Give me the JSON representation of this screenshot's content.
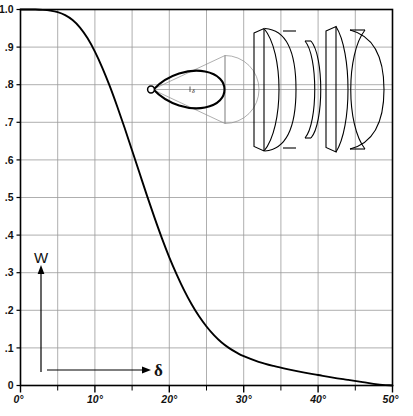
{
  "figure": {
    "title": "",
    "background_color": "#ffffff",
    "frame_color": "#000000",
    "grid_color": "#9a9a9a",
    "curve_color": "#000000"
  },
  "axes": {
    "y_label": "W",
    "x_label": "δ",
    "y_ticks": [
      "1.0",
      ".9",
      ".8",
      ".7",
      ".6",
      ".5",
      ".4",
      ".3",
      ".2",
      ".1",
      "0"
    ],
    "x_ticks": [
      "0°",
      "10°",
      "20°",
      "30°",
      "40°",
      "50°"
    ],
    "x_minor_ticks": [
      "5°",
      "15°",
      "25°",
      "35°",
      "45°"
    ]
  },
  "inset": {
    "cone_label": "δ",
    "lens_elements": 4,
    "optical_axis": true
  },
  "chart_data": {
    "type": "line",
    "title": "",
    "xlabel": "δ",
    "ylabel": "W",
    "xlim": [
      0,
      50
    ],
    "ylim": [
      0,
      1.0
    ],
    "grid": true,
    "legend": "none",
    "x_unit": "degrees",
    "x": [
      0,
      1,
      2,
      3,
      4,
      5,
      6,
      7,
      8,
      9,
      10,
      11,
      12,
      13,
      14,
      15,
      16,
      17,
      18,
      19,
      20,
      21,
      22,
      23,
      24,
      25,
      26,
      27,
      28,
      29,
      30,
      32,
      34,
      36,
      38,
      40,
      42,
      44,
      46,
      48,
      50
    ],
    "values": [
      1.0,
      1.0,
      1.0,
      0.999,
      0.997,
      0.993,
      0.985,
      0.972,
      0.952,
      0.924,
      0.888,
      0.845,
      0.796,
      0.742,
      0.685,
      0.625,
      0.565,
      0.505,
      0.447,
      0.392,
      0.341,
      0.295,
      0.253,
      0.216,
      0.184,
      0.157,
      0.134,
      0.115,
      0.1,
      0.088,
      0.078,
      0.063,
      0.052,
      0.043,
      0.035,
      0.028,
      0.021,
      0.015,
      0.009,
      0.003,
      0.0
    ],
    "series": [
      {
        "name": "relative illumination",
        "values": [
          1.0,
          1.0,
          1.0,
          0.999,
          0.997,
          0.993,
          0.985,
          0.972,
          0.952,
          0.924,
          0.888,
          0.845,
          0.796,
          0.742,
          0.685,
          0.625,
          0.565,
          0.505,
          0.447,
          0.392,
          0.341,
          0.295,
          0.253,
          0.216,
          0.184,
          0.157,
          0.134,
          0.115,
          0.1,
          0.088,
          0.078,
          0.063,
          0.052,
          0.043,
          0.035,
          0.028,
          0.021,
          0.015,
          0.009,
          0.003,
          0.0
        ]
      }
    ]
  }
}
